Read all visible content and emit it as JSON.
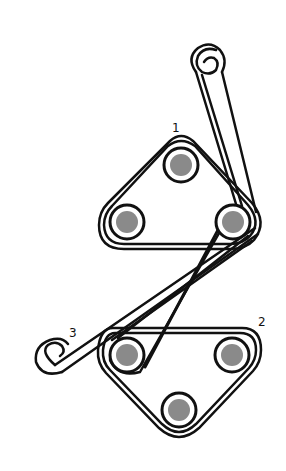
{
  "diagram": {
    "labels": {
      "unit1": "1",
      "unit2": "2",
      "belt3": "3"
    },
    "colors": {
      "belt": "#111111",
      "pulley_fill": "#8a8a8a",
      "background": "#ffffff"
    },
    "pulleys_unit1": [
      {
        "cx": 181,
        "cy": 165
      },
      {
        "cx": 127,
        "cy": 222
      },
      {
        "cx": 233,
        "cy": 222
      }
    ],
    "pulleys_unit2": [
      {
        "cx": 127,
        "cy": 355
      },
      {
        "cx": 232,
        "cy": 355
      },
      {
        "cx": 179,
        "cy": 410
      }
    ]
  }
}
